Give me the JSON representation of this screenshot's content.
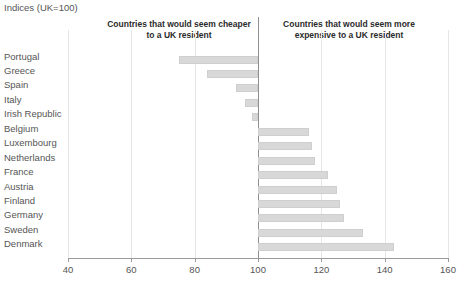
{
  "chart_data": {
    "type": "bar",
    "orientation": "horizontal",
    "title": "Indices (UK=100)",
    "xlabel": "",
    "ylabel": "",
    "xlim": [
      40,
      160
    ],
    "baseline": 100,
    "grid": true,
    "gridlines": [
      40,
      60,
      80,
      100,
      120,
      140,
      160
    ],
    "xticks": [
      40,
      60,
      80,
      100,
      120,
      140,
      160
    ],
    "xticklabels": [
      "40",
      "60",
      "80",
      "100",
      "120",
      "140",
      "160"
    ],
    "legend": "none",
    "annotations": [
      {
        "text": "Countries that would seem cheaper to a UK resident",
        "side": "left"
      },
      {
        "text": "Countries that would seem more expensive to a UK resident",
        "side": "right"
      }
    ],
    "categories": [
      "Portugal",
      "Greece",
      "Spain",
      "Italy",
      "Irish Republic",
      "Belgium",
      "Luxembourg",
      "Netherlands",
      "France",
      "Austria",
      "Finland",
      "Germany",
      "Sweden",
      "Denmark"
    ],
    "values": [
      75,
      84,
      93,
      96,
      98,
      116,
      117,
      118,
      122,
      125,
      126,
      127,
      133,
      143
    ],
    "series": [
      {
        "name": "Price level index (UK=100)",
        "values": [
          75,
          84,
          93,
          96,
          98,
          116,
          117,
          118,
          122,
          125,
          126,
          127,
          133,
          143
        ]
      }
    ],
    "bar_color": "#d8d8d8",
    "axis_color": "#9a9a9a",
    "grid_color": "#e6e6e6",
    "baseline_color": "#8f8f8f"
  }
}
